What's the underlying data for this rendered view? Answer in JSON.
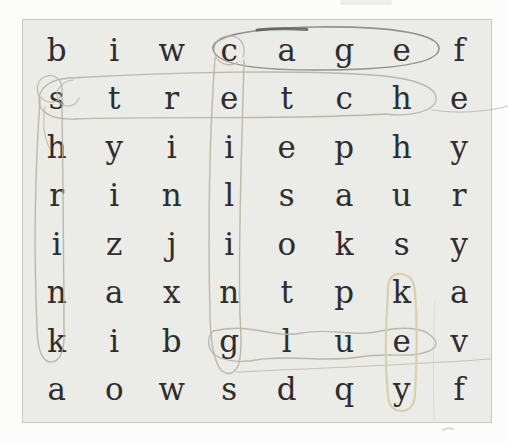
{
  "puzzle": {
    "type": "word-search",
    "grid_rows": 8,
    "grid_cols": 8,
    "grid": [
      [
        "b",
        "i",
        "w",
        "c",
        "a",
        "g",
        "e",
        "f"
      ],
      [
        "s",
        "t",
        "r",
        "e",
        "t",
        "c",
        "h",
        "e"
      ],
      [
        "h",
        "y",
        "i",
        "i",
        "e",
        "p",
        "h",
        "y"
      ],
      [
        "r",
        "i",
        "n",
        "l",
        "s",
        "a",
        "u",
        "r"
      ],
      [
        "i",
        "z",
        "j",
        "i",
        "o",
        "k",
        "s",
        "y"
      ],
      [
        "n",
        "a",
        "x",
        "n",
        "t",
        "p",
        "k",
        "a"
      ],
      [
        "k",
        "i",
        "b",
        "g",
        "l",
        "u",
        "e",
        "v"
      ],
      [
        "a",
        "o",
        "w",
        "s",
        "d",
        "q",
        "y",
        "f"
      ]
    ],
    "circled_words": [
      {
        "word": "cage",
        "direction": "across",
        "row": 1,
        "cols": "4-7",
        "pen_color": "#8c8c8a"
      },
      {
        "word": "stretch",
        "direction": "across",
        "row": 2,
        "cols": "1-7",
        "pen_color": "#b6b1a5"
      },
      {
        "word": "shrink",
        "direction": "down",
        "col": 1,
        "rows": "2-7",
        "pen_color": "#b6b1a5"
      },
      {
        "word": "ceiling",
        "direction": "down",
        "col": 4,
        "rows": "1-7",
        "pen_color": "#b6b1a5"
      },
      {
        "word": "glue",
        "direction": "across",
        "row": 7,
        "cols": "4-7",
        "pen_color": "#b6b1a5"
      },
      {
        "word": "key",
        "direction": "down",
        "col": 7,
        "rows": "6-8",
        "pen_color": "#d5cfa8"
      }
    ],
    "colors": {
      "paper": "#fcfcfb",
      "board_fill": "#ebebe8",
      "board_border": "#c7c7c3",
      "letter": "#2e2e2e",
      "dark_pen_accent": "#565656"
    }
  }
}
